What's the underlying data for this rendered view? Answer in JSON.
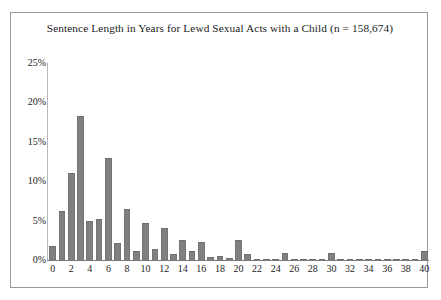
{
  "chart_data": {
    "type": "bar",
    "title": "Sentence Length in Years for Lewd Sexual Acts with a Child (n = 158,674)",
    "xlabel": "",
    "ylabel": "",
    "ylim": [
      0,
      25
    ],
    "grid": false,
    "legend": null,
    "bar_color": "#808080",
    "ytick_labels": [
      "25%",
      "20%",
      "15%",
      "10%",
      "5%",
      "0%"
    ],
    "ytick_values": [
      25,
      20,
      15,
      10,
      5,
      0
    ],
    "xtick_labels": [
      "0",
      "2",
      "4",
      "6",
      "8",
      "10",
      "12",
      "14",
      "16",
      "18",
      "20",
      "22",
      "24",
      "26",
      "28",
      "30",
      "32",
      "34",
      "36",
      "38",
      "40"
    ],
    "xtick_values": [
      0,
      2,
      4,
      6,
      8,
      10,
      12,
      14,
      16,
      18,
      20,
      22,
      24,
      26,
      28,
      30,
      32,
      34,
      36,
      38,
      40
    ],
    "categories": [
      0,
      1,
      2,
      3,
      4,
      5,
      6,
      7,
      8,
      9,
      10,
      11,
      12,
      13,
      14,
      15,
      16,
      17,
      18,
      19,
      20,
      21,
      22,
      23,
      24,
      25,
      26,
      27,
      28,
      29,
      30,
      31,
      32,
      33,
      34,
      35,
      36,
      37,
      38,
      39,
      40
    ],
    "values": [
      1.8,
      6.2,
      11.0,
      18.3,
      5.0,
      5.2,
      13.0,
      2.1,
      6.5,
      1.2,
      4.7,
      1.4,
      4.0,
      0.8,
      2.6,
      1.1,
      2.3,
      0.4,
      0.5,
      0.3,
      2.5,
      0.7,
      0.15,
      0.1,
      0.15,
      0.9,
      0.1,
      0.05,
      0.05,
      0.1,
      0.9,
      0.1,
      0.05,
      0.05,
      0.1,
      0.05,
      0.05,
      0.05,
      0.05,
      0.05,
      1.2
    ]
  }
}
